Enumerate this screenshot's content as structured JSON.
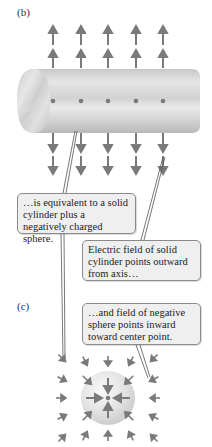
{
  "panels": {
    "b": {
      "label": "(b)"
    },
    "c": {
      "label": "(c)"
    }
  },
  "callouts": {
    "equivalent": "…is equivalent to a solid cylinder plus a negatively charged sphere.",
    "cylinder_field": "Electric field of solid cylinder points outward from axis…",
    "sphere_field": "…and field of negative sphere points inward toward center point."
  },
  "colors": {
    "arrow": "#7a7a7a",
    "cylinder": "#cfcfcf",
    "sphere": "#e0e0e0",
    "callout_bg": "#efefef",
    "callout_border": "#8a8a8a"
  },
  "icons": {
    "field_arrow": "arrow-icon",
    "charge_dot": "dot-icon"
  }
}
